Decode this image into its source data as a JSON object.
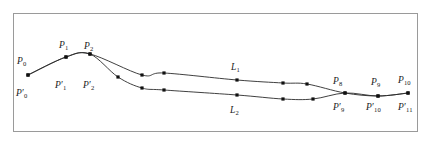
{
  "figure": {
    "background_color": "#ffffff",
    "frame_color": "#9a9a9a",
    "curve_color": "#2a2a2a",
    "vertex_color": "#111111"
  },
  "chart_data": {
    "type": "line",
    "title": "",
    "subtitle": "",
    "xlabel": "",
    "ylabel": "",
    "grid": false,
    "legend_position": "none",
    "xlim": [
      14,
      418
    ],
    "ylim": [
      14,
      132
    ],
    "series": [
      {
        "name": "L1",
        "label": "L1",
        "points": [
          {
            "x": 28,
            "y": 75,
            "label": "P0",
            "label_pos": "above"
          },
          {
            "x": 66,
            "y": 57,
            "label": "P1",
            "label_pos": "above"
          },
          {
            "x": 90,
            "y": 54,
            "label": "P2",
            "label_pos": "above"
          },
          {
            "x": 142,
            "y": 75,
            "label": "",
            "label_pos": "none"
          },
          {
            "x": 164,
            "y": 73,
            "label": "",
            "label_pos": "none"
          },
          {
            "x": 237,
            "y": 80,
            "label": "L1",
            "label_pos": "above"
          },
          {
            "x": 283,
            "y": 83,
            "label": "",
            "label_pos": "none"
          },
          {
            "x": 307,
            "y": 84,
            "label": "",
            "label_pos": "none"
          },
          {
            "x": 345,
            "y": 93,
            "label": "P8",
            "label_pos": "above"
          },
          {
            "x": 378,
            "y": 96,
            "label": "P9",
            "label_pos": "above"
          },
          {
            "x": 408,
            "y": 93,
            "label": "P10",
            "label_pos": "above"
          }
        ]
      },
      {
        "name": "L2",
        "label": "L2",
        "points": [
          {
            "x": 28,
            "y": 75,
            "label": "P'0",
            "label_pos": "below"
          },
          {
            "x": 66,
            "y": 57,
            "label": "P'1",
            "label_pos": "below"
          },
          {
            "x": 90,
            "y": 54,
            "label": "P'2",
            "label_pos": "below"
          },
          {
            "x": 118,
            "y": 77,
            "label": "",
            "label_pos": "none"
          },
          {
            "x": 142,
            "y": 88,
            "label": "",
            "label_pos": "none"
          },
          {
            "x": 164,
            "y": 90,
            "label": "",
            "label_pos": "none"
          },
          {
            "x": 237,
            "y": 95,
            "label": "L2",
            "label_pos": "below"
          },
          {
            "x": 283,
            "y": 99,
            "label": "",
            "label_pos": "none"
          },
          {
            "x": 313,
            "y": 99,
            "label": "",
            "label_pos": "none"
          },
          {
            "x": 345,
            "y": 93,
            "label": "P'9",
            "label_pos": "below"
          },
          {
            "x": 378,
            "y": 96,
            "label": "P'10",
            "label_pos": "below"
          },
          {
            "x": 408,
            "y": 93,
            "label": "P'11",
            "label_pos": "below"
          }
        ]
      }
    ]
  },
  "labels": {
    "upper": [
      {
        "name": "label-p0",
        "base": "P",
        "prime": false,
        "sub": "0",
        "x": 17,
        "y": 57
      },
      {
        "name": "label-p1",
        "base": "P",
        "prime": false,
        "sub": "1",
        "x": 59,
        "y": 41
      },
      {
        "name": "label-p2",
        "base": "P",
        "prime": false,
        "sub": "2",
        "x": 84,
        "y": 42
      },
      {
        "name": "label-l1",
        "base": "L",
        "prime": false,
        "sub": "1",
        "x": 231,
        "y": 63
      },
      {
        "name": "label-p8",
        "base": "P",
        "prime": false,
        "sub": "8",
        "x": 333,
        "y": 77
      },
      {
        "name": "label-p9",
        "base": "P",
        "prime": false,
        "sub": "9",
        "x": 371,
        "y": 78
      },
      {
        "name": "label-p10",
        "base": "P",
        "prime": false,
        "sub": "10",
        "x": 398,
        "y": 76
      }
    ],
    "lower": [
      {
        "name": "label-p0-prime",
        "base": "P",
        "prime": true,
        "sub": "0",
        "x": 16,
        "y": 89
      },
      {
        "name": "label-p1-prime",
        "base": "P",
        "prime": true,
        "sub": "1",
        "x": 55,
        "y": 81
      },
      {
        "name": "label-p2-prime",
        "base": "P",
        "prime": true,
        "sub": "2",
        "x": 83,
        "y": 81
      },
      {
        "name": "label-l2",
        "base": "L",
        "prime": false,
        "sub": "2",
        "x": 230,
        "y": 106
      },
      {
        "name": "label-p9-prime",
        "base": "P",
        "prime": true,
        "sub": "9",
        "x": 333,
        "y": 103
      },
      {
        "name": "label-p10-prime",
        "base": "P",
        "prime": true,
        "sub": "10",
        "x": 366,
        "y": 103
      },
      {
        "name": "label-p11-prime",
        "base": "P",
        "prime": true,
        "sub": "11",
        "x": 398,
        "y": 103
      }
    ]
  }
}
